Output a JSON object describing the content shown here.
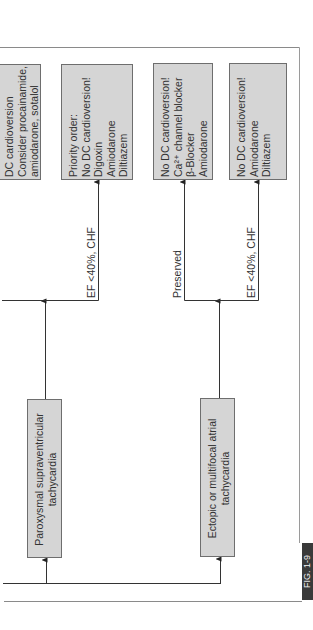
{
  "figure": {
    "label": "FIG. 1-9",
    "orientation": "rotated -90deg (landscape page)"
  },
  "colors": {
    "box_fill": "#d5d5d5",
    "box_border": "#6e6e6e",
    "line": "#333333",
    "fig_tab": "#3a3a3a"
  },
  "source_nodes": [
    {
      "id": "psvt",
      "lines": [
        "Paroxysmal supraventricular",
        "tachycardia"
      ]
    },
    {
      "id": "ectopic",
      "lines": [
        "Ectopic or multifocal atrial",
        "tachycardia"
      ]
    }
  ],
  "edge_labels": {
    "psvt_ef": "EF <40%, CHF",
    "ectopic_preserved": "Preserved",
    "ectopic_ef": "EF <40%, CHF"
  },
  "outcome_nodes": [
    {
      "id": "dc",
      "lines": [
        "DC cardioversion",
        "Consider procainamide,",
        "amiodarone, sotalol"
      ]
    },
    {
      "id": "psvt_low_ef",
      "lines": [
        "Priority order:",
        "No DC cardioversion!",
        "Digoxin",
        "Amiodarone",
        "Diltiazem"
      ]
    },
    {
      "id": "ectopic_preserved",
      "lines": [
        "No DC cardioversion!",
        "Ca²⁺ channel blocker",
        "β-Blocker",
        "Amiodarone"
      ]
    },
    {
      "id": "ectopic_low_ef",
      "lines": [
        "No DC cardioversion!",
        "Amiodarone",
        "Diltiazem"
      ]
    }
  ]
}
